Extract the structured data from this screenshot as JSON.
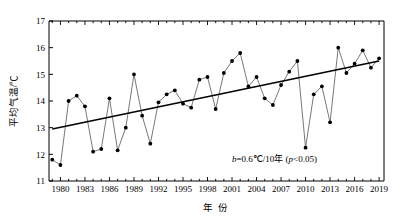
{
  "chart_data": {
    "type": "line",
    "title": "",
    "subtitle": "",
    "xlabel": "年 份",
    "ylabel": "平均气温/℃",
    "xlim": [
      1978.6,
      2019.6
    ],
    "ylim": [
      11,
      17
    ],
    "yticks": [
      "11",
      "12",
      "13",
      "14",
      "15",
      "16",
      "17"
    ],
    "ytick_values": [
      11,
      12,
      13,
      14,
      15,
      16,
      17
    ],
    "xticks": [
      "1980",
      "1983",
      "1986",
      "1989",
      "1992",
      "1995",
      "1998",
      "2001",
      "2004",
      "2007",
      "2010",
      "2013",
      "2016",
      "2019"
    ],
    "xtick_values": [
      1980,
      1983,
      1986,
      1989,
      1992,
      1995,
      1998,
      2001,
      2004,
      2007,
      2010,
      2013,
      2016,
      2019
    ],
    "grid": false,
    "legend": false,
    "marker": "filled-circle",
    "x": [
      1979,
      1980,
      1981,
      1982,
      1983,
      1984,
      1985,
      1986,
      1987,
      1988,
      1989,
      1990,
      1991,
      1992,
      1993,
      1994,
      1995,
      1996,
      1997,
      1998,
      1999,
      2000,
      2001,
      2002,
      2003,
      2004,
      2005,
      2006,
      2007,
      2008,
      2009,
      2010,
      2011,
      2012,
      2013,
      2014,
      2015,
      2016,
      2017,
      2018,
      2019
    ],
    "series": [
      {
        "name": "年平均气温",
        "values": [
          11.8,
          11.6,
          14.0,
          14.2,
          13.8,
          12.1,
          12.2,
          14.1,
          12.15,
          13.0,
          15.0,
          13.45,
          12.4,
          13.95,
          14.25,
          14.4,
          13.9,
          13.75,
          14.8,
          14.9,
          13.7,
          15.05,
          15.5,
          15.8,
          14.55,
          14.9,
          14.1,
          13.85,
          14.6,
          15.1,
          15.5,
          12.25,
          14.25,
          14.55,
          13.2,
          16.0,
          15.05,
          15.4,
          15.9,
          15.25,
          15.6
        ]
      },
      {
        "name": "线性趋势",
        "type": "trend",
        "x": [
          1979,
          2019
        ],
        "values": [
          12.95,
          15.5
        ]
      }
    ],
    "annotations": [
      {
        "text": "b=0.6℃/10年 (p<0.05)",
        "italic_parts": [
          "b",
          "p"
        ],
        "x": 2006,
        "y": 11.75
      }
    ]
  },
  "annotation": {
    "b_symbol": "b",
    "slope_text": "=0.6℃/10年 (",
    "p_symbol": "p",
    "p_text": "<0.05)"
  }
}
